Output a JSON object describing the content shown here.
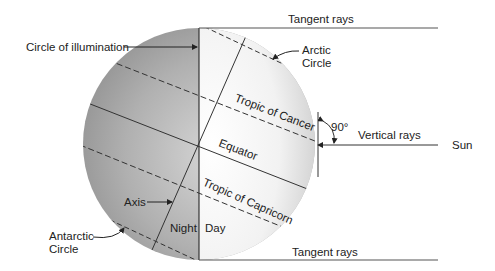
{
  "diagram": {
    "labels": {
      "circle_of_illumination": "Circle of illumination",
      "tangent_rays_top": "Tangent rays",
      "tangent_rays_bottom": "Tangent rays",
      "arctic_circle_line1": "Arctic",
      "arctic_circle_line2": "Circle",
      "tropic_of_cancer": "Tropic of Cancer",
      "equator": "Equator",
      "tropic_of_capricorn": "Tropic of Capricorn",
      "angle": "90°",
      "vertical_rays": "Vertical rays",
      "sun": "Sun",
      "axis": "Axis",
      "night": "Night",
      "day": "Day",
      "antarctic_circle_line1": "Antarctic",
      "antarctic_circle_line2": "Circle"
    },
    "colors": {
      "night_shade": "#9a9a9a",
      "day_shade": "#f4f4f4",
      "line": "#333333",
      "background": "#ffffff"
    }
  }
}
